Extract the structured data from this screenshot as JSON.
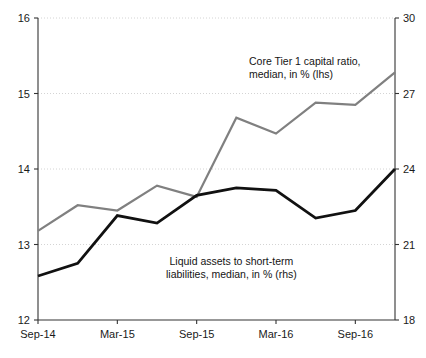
{
  "chart_data": {
    "type": "line",
    "title": "",
    "xlabel": "",
    "ylabel": "",
    "grid": true,
    "legend_position": "inline-annotation",
    "x_tick_labels": [
      "Sep-14",
      "Mar-15",
      "Sep-15",
      "Mar-16",
      "Sep-16"
    ],
    "x_tick_values": [
      "2014-09",
      "2015-03",
      "2015-09",
      "2016-03",
      "2016-09"
    ],
    "x": [
      "2014-09",
      "2014-12",
      "2015-03",
      "2015-06",
      "2015-09",
      "2015-12",
      "2016-03",
      "2016-06",
      "2016-09",
      "2016-12"
    ],
    "left_axis": {
      "label": "",
      "ylim": [
        12,
        16
      ],
      "ticks": [
        12,
        13,
        14,
        15,
        16
      ],
      "tick_labels": [
        "12",
        "13",
        "14",
        "15",
        "16"
      ]
    },
    "right_axis": {
      "label": "",
      "ylim": [
        18,
        30
      ],
      "ticks": [
        18,
        21,
        24,
        27,
        30
      ],
      "tick_labels": [
        "18",
        "21",
        "24",
        "27",
        "30"
      ]
    },
    "series": [
      {
        "name": "Core Tier 1 capital ratio, median, in % (lhs)",
        "axis": "left",
        "color": "#808080",
        "values": [
          13.18,
          13.52,
          13.45,
          13.78,
          13.63,
          14.68,
          14.47,
          14.88,
          14.85,
          15.28
        ]
      },
      {
        "name": "Liquid assets to short-term liabilities, median, in % (rhs)",
        "axis": "right",
        "color": "#111111",
        "values": [
          19.75,
          20.25,
          22.15,
          21.85,
          22.95,
          23.25,
          23.15,
          22.05,
          22.35,
          24.0
        ]
      }
    ],
    "annotations": [
      {
        "id": "gray",
        "line1": "Core Tier 1 capital ratio,",
        "line2": "median, in % (lhs)"
      },
      {
        "id": "black",
        "line1": "Liquid assets to short-term",
        "line2": "liabilities, median, in % (rhs)"
      }
    ],
    "colors": {
      "series_gray": "#808080",
      "series_black": "#111111",
      "axis": "#333333",
      "gridline": "#c9c9c9",
      "background": "#ffffff"
    }
  }
}
